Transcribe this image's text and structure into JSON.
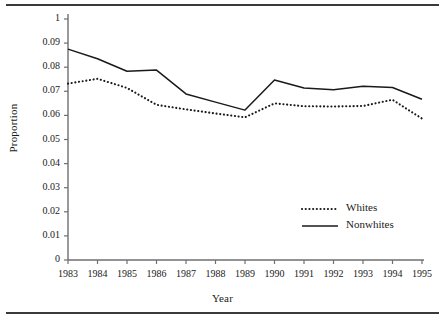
{
  "chart_data": {
    "type": "line",
    "title": "",
    "xlabel": "Year",
    "ylabel": "Proportion",
    "grid": false,
    "legend_position": "inside-lower-right",
    "categories": [
      "1983",
      "1984",
      "1985",
      "1986",
      "1987",
      "1988",
      "1989",
      "1990",
      "1991",
      "1992",
      "1993",
      "1994",
      "1995"
    ],
    "x": [
      1983,
      1984,
      1985,
      1986,
      1987,
      1988,
      1989,
      1990,
      1991,
      1992,
      1993,
      1994,
      1995
    ],
    "xlim": [
      1983,
      1995
    ],
    "ylim": [
      0,
      0.1
    ],
    "ytick_labels": [
      "0",
      "0.01",
      "0.02",
      "0.03",
      "0.04",
      "0.05",
      "0.06",
      "0.07",
      "0.08",
      "0.09",
      "1"
    ],
    "ytick_values": [
      0,
      0.01,
      0.02,
      0.03,
      0.04,
      0.05,
      0.06,
      0.07,
      0.08,
      0.09,
      0.1
    ],
    "xtick_labels": [
      "1983",
      "1984",
      "1985",
      "1986",
      "1987",
      "1988",
      "1989",
      "1990",
      "1991",
      "1992",
      "1993",
      "1994",
      "1995"
    ],
    "series": [
      {
        "name": "Whites",
        "style": "dotted",
        "color": "#1a1a1a",
        "values": [
          0.0732,
          0.0752,
          0.0714,
          0.0644,
          0.0625,
          0.0608,
          0.0592,
          0.065,
          0.0638,
          0.0637,
          0.0639,
          0.0665,
          0.0587
        ]
      },
      {
        "name": "Nonwhites",
        "style": "solid",
        "color": "#1a1a1a",
        "values": [
          0.0875,
          0.0835,
          0.0783,
          0.0788,
          0.0689,
          0.0655,
          0.0622,
          0.0747,
          0.0714,
          0.0706,
          0.0721,
          0.0716,
          0.0667
        ]
      }
    ]
  },
  "legend": {
    "entries": [
      {
        "label": "Whites",
        "style": "dotted"
      },
      {
        "label": "Nonwhites",
        "style": "solid"
      }
    ]
  },
  "axes": {
    "y_title": "Proportion",
    "x_title": "Year"
  }
}
